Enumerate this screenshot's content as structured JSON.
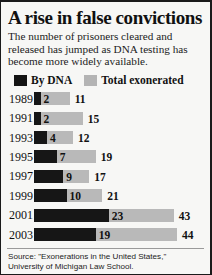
{
  "headline": "A rise in false convictions",
  "subhead": "The number of prisoners cleared and released has jumped as DNA testing has become more widely available.",
  "legend": {
    "dna": {
      "label": "By DNA",
      "color": "#141414",
      "icon": "legend-swatch-dark"
    },
    "total": {
      "label": "Total exonerated",
      "color": "#b4b4b4",
      "icon": "legend-swatch-gray"
    }
  },
  "source": "Source: \"Exonerations in the United States,\" University of Michigan Law School.",
  "credit": "By Julie Snider, USA TODAY, 2004",
  "chart_data": {
    "type": "bar",
    "orientation": "horizontal",
    "title": "A rise in false convictions",
    "subtitle": "The number of prisoners cleared and released has jumped as DNA testing has become more widely available.",
    "xlabel": "",
    "ylabel": "",
    "xlim": [
      0,
      44
    ],
    "grid": false,
    "legend_position": "top-left",
    "categories": [
      "1989",
      "1991",
      "1993",
      "1995",
      "1997",
      "1999",
      "2001",
      "2003"
    ],
    "series": [
      {
        "name": "By DNA",
        "color": "#141414",
        "values": [
          2,
          2,
          4,
          7,
          9,
          10,
          23,
          19
        ]
      },
      {
        "name": "Total exonerated",
        "color": "#b4b4b4",
        "values": [
          11,
          15,
          12,
          19,
          17,
          21,
          43,
          44
        ]
      }
    ],
    "rows": [
      {
        "year": "1989",
        "dna": 2,
        "dna_label": "2",
        "total": 11,
        "total_label": "11"
      },
      {
        "year": "1991",
        "dna": 2,
        "dna_label": "2",
        "total": 15,
        "total_label": "15"
      },
      {
        "year": "1993",
        "dna": 4,
        "dna_label": "4",
        "total": 12,
        "total_label": "12"
      },
      {
        "year": "1995",
        "dna": 7,
        "dna_label": "7",
        "total": 19,
        "total_label": "19"
      },
      {
        "year": "1997",
        "dna": 9,
        "dna_label": "9",
        "total": 17,
        "total_label": "17"
      },
      {
        "year": "1999",
        "dna": 10,
        "dna_label": "10",
        "total": 21,
        "total_label": "21"
      },
      {
        "year": "2001",
        "dna": 23,
        "dna_label": "23",
        "total": 43,
        "total_label": "43"
      },
      {
        "year": "2003",
        "dna": 19,
        "dna_label": "19",
        "total": 44,
        "total_label": "44"
      }
    ]
  }
}
